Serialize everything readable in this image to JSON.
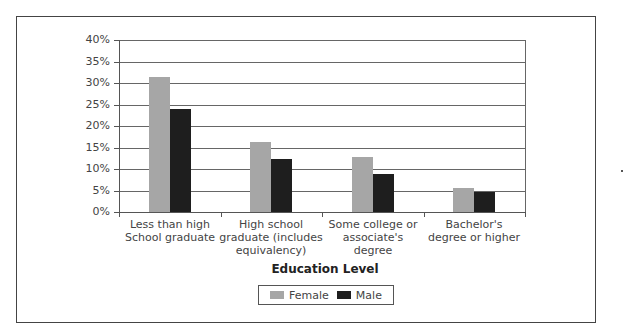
{
  "chart_data": {
    "type": "bar",
    "title": "",
    "xlabel": "Education Level",
    "ylabel": "",
    "ylim": [
      0,
      40
    ],
    "yticks": [
      "0%",
      "5%",
      "10%",
      "15%",
      "20%",
      "25%",
      "30%",
      "35%",
      "40%"
    ],
    "categories": [
      "Less than high School graduate",
      "High school graduate (includes equivalency)",
      "Some college or associate's degree",
      "Bachelor's degree or higher"
    ],
    "category_lines": [
      [
        "Less than high",
        "School graduate"
      ],
      [
        "High school",
        "graduate (includes",
        "equivalency)"
      ],
      [
        "Some college or",
        "associate's",
        "degree"
      ],
      [
        "Bachelor's",
        "degree or higher"
      ]
    ],
    "series": [
      {
        "name": "Female",
        "color": "#a6a6a6",
        "values": [
          31.4,
          16.3,
          12.8,
          5.6
        ]
      },
      {
        "name": "Male",
        "color": "#1e1e1e",
        "values": [
          24.0,
          12.3,
          8.8,
          4.7
        ]
      }
    ],
    "grid": true,
    "legend_position": "bottom"
  },
  "legend": {
    "female": "Female",
    "male": "Male"
  }
}
